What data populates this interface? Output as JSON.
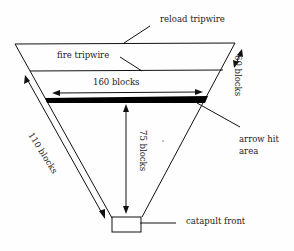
{
  "diagram": {
    "labels": {
      "reload_tripwire": "reload tripwire",
      "fire_tripwire": "fire tripwire",
      "width": "160 blocks",
      "height_right": "60 blocks",
      "side_length": "110 blocks",
      "center_height": "75 blocks",
      "arrow_hit_area_line1": "arrow hit",
      "arrow_hit_area_line2": "area",
      "catapult_front": "catapult front"
    },
    "colors": {
      "line": "#111111",
      "hit_area": "#000000",
      "background": "#fefefe"
    }
  }
}
